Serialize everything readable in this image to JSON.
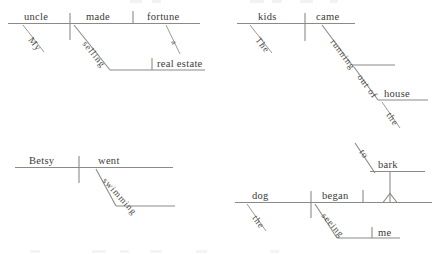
{
  "page": {
    "background_color": "#ffffff",
    "line_color": "#8a8a86",
    "text_color": "#3a3a38"
  },
  "diagrams": [
    {
      "id": "diagram-1",
      "sentence": "My uncle made a fortune selling real estate.",
      "subject": "uncle",
      "verb": "made",
      "object": "fortune",
      "subject_modifier": "My",
      "object_modifier": "a",
      "gerund": "selling",
      "gerund_object": "real estate"
    },
    {
      "id": "diagram-2",
      "sentence": "The kids came running out of the house.",
      "subject": "kids",
      "verb": "came",
      "subject_modifier": "The",
      "participle": "running",
      "preposition": "out of",
      "prep_object": "house",
      "prep_object_modifier": "the"
    },
    {
      "id": "diagram-3",
      "sentence": "Betsy went swimming.",
      "subject": "Betsy",
      "verb": "went",
      "participle": "swimming"
    },
    {
      "id": "diagram-4",
      "sentence": "The dog began seeing me to bark.",
      "subject": "dog",
      "verb": "began",
      "subject_modifier": "the",
      "gerund": "seeing",
      "gerund_object": "me",
      "infinitive": "to bark",
      "infinitive_particle": "to",
      "infinitive_verb": "bark"
    }
  ],
  "labels": {
    "uncle": "uncle",
    "made": "made",
    "fortune": "fortune",
    "my": "My",
    "a": "a",
    "selling": "selling",
    "real_estate": "real estate",
    "kids": "kids",
    "came": "came",
    "the_kids": "The",
    "running": "running",
    "out_of": "out of",
    "house": "house",
    "the_house": "the",
    "betsy": "Betsy",
    "went": "went",
    "swimming": "swimming",
    "dog": "dog",
    "began": "began",
    "the_dog": "the",
    "seeing": "seeing",
    "me": "me",
    "to": "to",
    "bark": "bark"
  }
}
